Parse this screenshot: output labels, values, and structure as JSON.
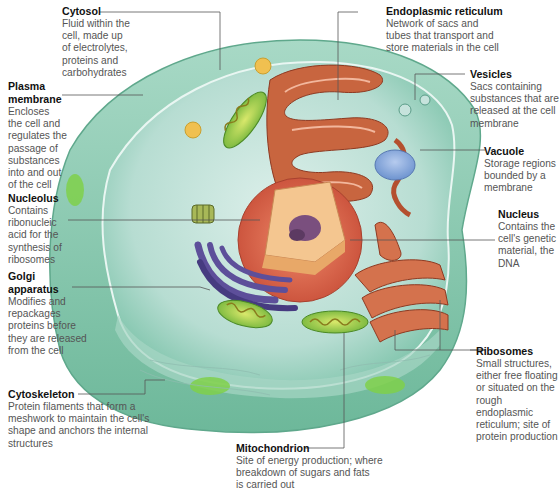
{
  "diagram": {
    "colors": {
      "cytoplasm": "#bfe0d8",
      "membrane": "#7ec4ad",
      "nucleus_envelope": "#e0735a",
      "nucleus_interior": "#f2c48a",
      "nucleolus": "#7a4f7e",
      "er": "#c8653f",
      "golgi": "#5d4f9a",
      "mitochondria": "#8cc63f",
      "vacuole": "#7fa3d6",
      "leader_line": "#555555"
    }
  },
  "labels": {
    "cytosol": {
      "title": "Cytosol",
      "desc": [
        "Fluid within the",
        "cell, made up",
        "of electrolytes,",
        "proteins and",
        "carbohydrates"
      ]
    },
    "plasma_membrane": {
      "title": [
        "Plasma",
        "membrane"
      ],
      "desc": [
        "Encloses",
        "the cell and",
        "regulates the",
        "passage of",
        "substances",
        "into and out",
        "of the cell"
      ]
    },
    "nucleolus": {
      "title": "Nucleolus",
      "desc": [
        "Contains",
        "ribonucleic",
        "acid for the",
        "synthesis of",
        "ribosomes"
      ]
    },
    "golgi": {
      "title": [
        "Golgi",
        "apparatus"
      ],
      "desc": [
        "Modifies and",
        "repackages",
        "proteins before",
        "they are released",
        "from the cell"
      ]
    },
    "cytoskeleton": {
      "title": "Cytoskeleton",
      "desc": [
        "Protein filaments that form a",
        "meshwork to maintain the cell's",
        "shape and anchors the internal",
        "structures"
      ]
    },
    "er": {
      "title": "Endoplasmic reticulum",
      "desc": [
        "Network of sacs and",
        "tubes that transport and",
        "store materials in the cell"
      ]
    },
    "vesicles": {
      "title": "Vesicles",
      "desc": [
        "Sacs containing",
        "substances that are",
        "released at the cell",
        "membrane"
      ]
    },
    "vacuole": {
      "title": "Vacuole",
      "desc": [
        "Storage regions",
        "bounded by a",
        "membrane"
      ]
    },
    "nucleus": {
      "title": "Nucleus",
      "desc": [
        "Contains the",
        "cell's genetic",
        "material, the",
        "DNA"
      ]
    },
    "ribosomes": {
      "title": "Ribosomes",
      "desc": [
        "Small structures,",
        "either free floating",
        "or situated on the",
        "rough endoplasmic",
        "reticulum; site of",
        "protein production"
      ]
    },
    "mitochondrion": {
      "title": "Mitochondrion",
      "desc": [
        "Site of energy production; where",
        "breakdown of sugars and fats",
        "is carried out"
      ]
    }
  }
}
